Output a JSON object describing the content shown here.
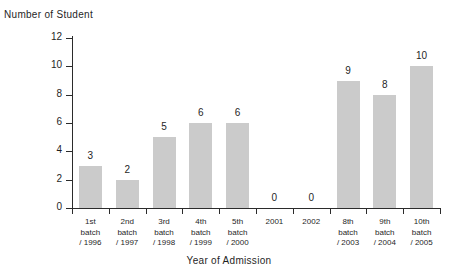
{
  "chart_data": {
    "type": "bar",
    "title": "",
    "xlabel": "Year of Admission",
    "ylabel": "Number of Student",
    "categories": [
      "1st batch / 1996",
      "2nd batch / 1997",
      "3rd batch / 1998",
      "4th batch / 1999",
      "5th batch / 2000",
      "2001",
      "2002",
      "8th batch / 2003",
      "9th batch / 2004",
      "10th batch / 2005"
    ],
    "category_lines": [
      [
        "1st",
        "batch",
        "/ 1996"
      ],
      [
        "2nd",
        "batch",
        "/ 1997"
      ],
      [
        "3rd",
        "batch",
        "/ 1998"
      ],
      [
        "4th",
        "batch",
        "/ 1999"
      ],
      [
        "5th",
        "batch",
        "/ 2000"
      ],
      [
        "2001",
        "",
        ""
      ],
      [
        "2002",
        "",
        ""
      ],
      [
        "8th",
        "batch",
        "/ 2003"
      ],
      [
        "9th",
        "batch",
        "/ 2004"
      ],
      [
        "10th",
        "batch",
        "/ 2005"
      ]
    ],
    "values": [
      3,
      2,
      5,
      6,
      6,
      0,
      0,
      9,
      8,
      10
    ],
    "value_labels": [
      "3",
      "2",
      "5",
      "6",
      "6",
      "0",
      "0",
      "9",
      "8",
      "10"
    ],
    "ylim": [
      0,
      12
    ],
    "yticks": [
      0,
      2,
      4,
      6,
      8,
      10,
      12
    ],
    "ytick_labels": [
      "0",
      "2",
      "4",
      "6",
      "8",
      "10",
      "12"
    ],
    "grid": false,
    "legend": false,
    "bar_color": "#cbcbcb",
    "axis_color": "#2b2b2b"
  }
}
